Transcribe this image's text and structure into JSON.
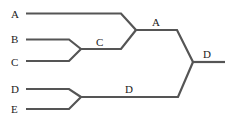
{
  "diagram": {
    "type": "tree",
    "colors": {
      "line": "#555555",
      "text": "#222222",
      "background": "#ffffff"
    },
    "leaves": [
      {
        "id": "A",
        "label": "A"
      },
      {
        "id": "B",
        "label": "B"
      },
      {
        "id": "C",
        "label": "C"
      },
      {
        "id": "D",
        "label": "D"
      },
      {
        "id": "E",
        "label": "E"
      }
    ],
    "merges": [
      {
        "inputs": [
          "B",
          "C"
        ],
        "result_label": "C"
      },
      {
        "inputs": [
          "A",
          "C"
        ],
        "result_label": "A"
      },
      {
        "inputs": [
          "D",
          "E"
        ],
        "result_label": "D"
      },
      {
        "inputs": [
          "A",
          "D"
        ],
        "result_label": "D"
      }
    ],
    "labels": {
      "leaf_a": "A",
      "leaf_b": "B",
      "leaf_c": "C",
      "leaf_d": "D",
      "leaf_e": "E",
      "merge_bc": "C",
      "merge_ac": "A",
      "merge_de": "D",
      "root": "D"
    }
  }
}
